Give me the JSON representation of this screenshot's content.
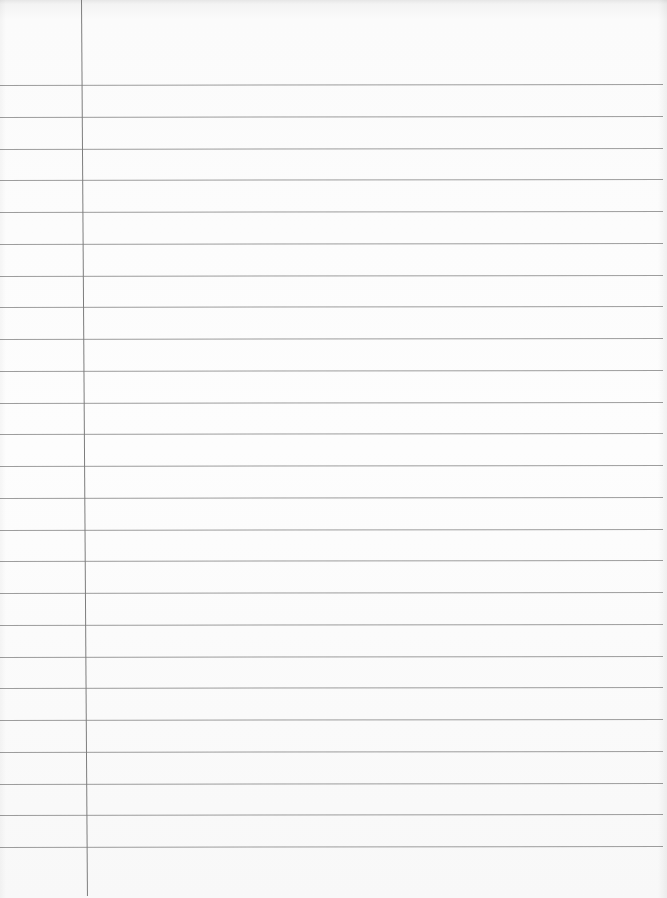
{
  "page": {
    "type": "ruled-notebook-paper",
    "content_text": ""
  },
  "ruling": {
    "line_count": 25,
    "first_line_y": 85,
    "line_spacing": 31.75,
    "line_color": "#8c8c8c",
    "paper_color": "#fdfdfd"
  },
  "margin": {
    "x_top": 81,
    "x_bottom": 87,
    "color": "#7d7d7d"
  }
}
